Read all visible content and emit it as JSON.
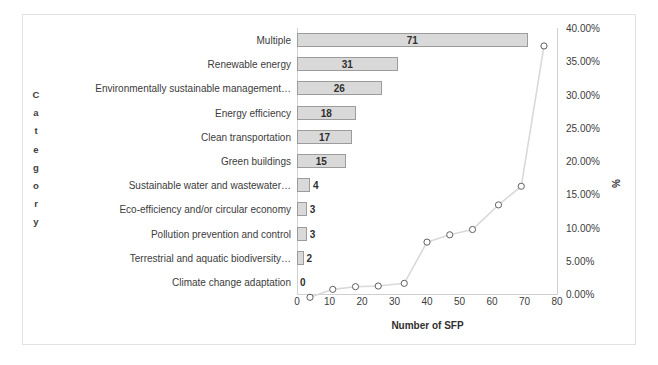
{
  "chart_data": {
    "type": "bar",
    "title": "",
    "subtitle": "",
    "xlabel": "Number of SFP",
    "ylabel": "Category",
    "y2label": "%",
    "orientation": "horizontal",
    "grid": false,
    "legend": "none",
    "xlim": [
      0,
      80
    ],
    "xticks": [
      "0",
      "10",
      "20",
      "30",
      "40",
      "50",
      "60",
      "70",
      "80"
    ],
    "y2lim": [
      0,
      40
    ],
    "y2ticks": [
      "0.00%",
      "5.00%",
      "10.00%",
      "15.00%",
      "20.00%",
      "25.00%",
      "30.00%",
      "35.00%",
      "40.00%"
    ],
    "categories": [
      "Multiple",
      "Renewable energy",
      "Environmentally sustainable management…",
      "Energy efficiency",
      "Clean transportation",
      "Green buildings",
      "Sustainable water and wastewater…",
      "Eco-efficiency and/or circular economy",
      "Pollution prevention and control",
      "Terrestrial and aquatic biodiversity…",
      "Climate change adaptation"
    ],
    "series": [
      {
        "name": "Number of SFP",
        "type": "bar",
        "values": [
          71,
          31,
          26,
          18,
          17,
          15,
          4,
          3,
          3,
          2,
          0
        ],
        "labels": [
          "71",
          "31",
          "26",
          "18",
          "17",
          "15",
          "4",
          "3",
          "3",
          "2",
          "0"
        ]
      },
      {
        "name": "%",
        "type": "line",
        "marker": "open-circle",
        "x": [
          4,
          11,
          18,
          25,
          33,
          40,
          47,
          54,
          62,
          69,
          76
        ],
        "values": [
          -0.5,
          0.7,
          1.1,
          1.2,
          1.6,
          7.8,
          8.9,
          9.7,
          13.4,
          16.2,
          37.3
        ]
      }
    ],
    "axis_title_letters_category": [
      "C",
      "a",
      "t",
      "e",
      "g",
      "o",
      "r",
      "y"
    ],
    "colors": {
      "bar_fill": "#d9d9d9",
      "bar_border": "#9c9c9c",
      "line": "#d9d9d9",
      "marker_border": "#606060",
      "marker_fill": "#ffffff",
      "text": "#3c3c3c",
      "frame": "#e2e2e2",
      "axis": "#d0d0d0",
      "background": "#ffffff"
    }
  }
}
